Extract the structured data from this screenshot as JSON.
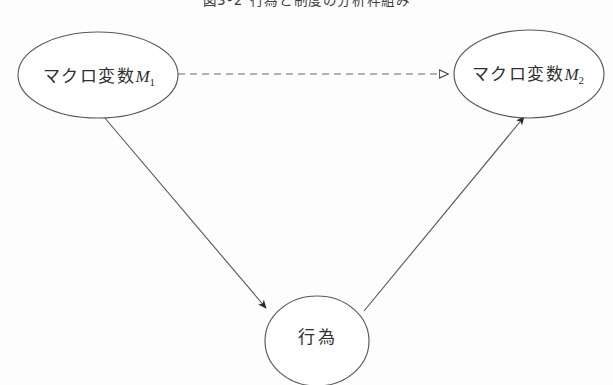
{
  "figure": {
    "title": "図3-2 行為と制度の分析枠組み",
    "background_color": "#fdfdfd",
    "stroke_color": "#595959",
    "text_color": "#2f2f2f",
    "width": 613,
    "height": 385
  },
  "nodes": [
    {
      "id": "macro-variable-1",
      "label_cjk": "マクロ変数",
      "label_var": "M",
      "label_sub": "1",
      "shape": "ellipse",
      "cx": 98,
      "cy": 75,
      "rx": 80,
      "ry": 43
    },
    {
      "id": "macro-variable-2",
      "label_cjk": "マクロ変数",
      "label_var": "M",
      "label_sub": "2",
      "shape": "ellipse",
      "cx": 529,
      "cy": 74,
      "rx": 75,
      "ry": 44
    },
    {
      "id": "behavior",
      "label_cjk": "行為",
      "label_var": "",
      "label_sub": "",
      "shape": "ellipse",
      "cx": 317,
      "cy": 341,
      "rx": 52,
      "ry": 45
    }
  ],
  "edges": [
    {
      "id": "macro1-to-macro2",
      "from": "macro-variable-1",
      "to": "macro-variable-2",
      "style": "dashed",
      "arrowhead": "open",
      "label": ""
    },
    {
      "id": "macro1-to-behavior",
      "from": "macro-variable-1",
      "to": "behavior",
      "style": "solid",
      "arrowhead": "filled",
      "label": ""
    },
    {
      "id": "behavior-to-macro2",
      "from": "behavior",
      "to": "macro-variable-2",
      "style": "solid",
      "arrowhead": "filled",
      "label": ""
    }
  ]
}
